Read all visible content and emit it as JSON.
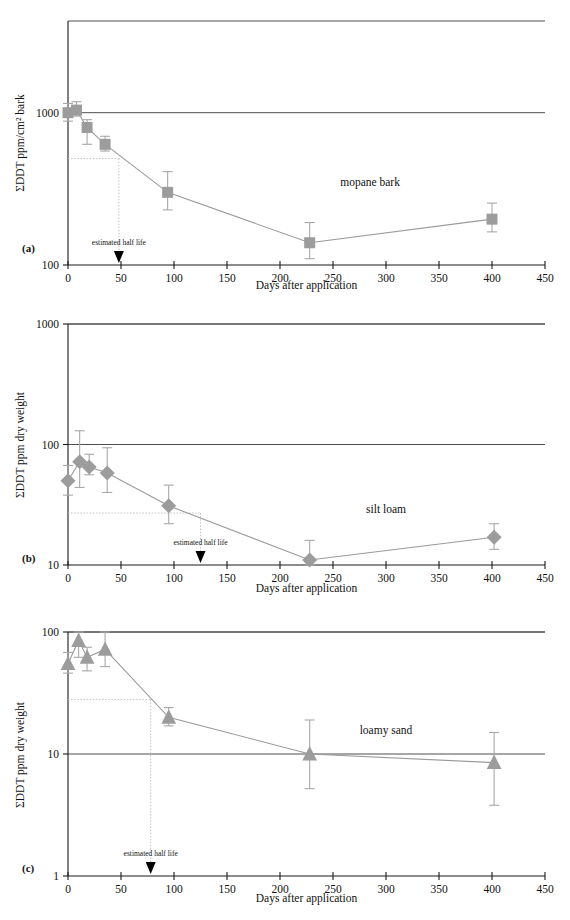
{
  "figure": {
    "panels": [
      {
        "letter": "(a)",
        "series_label": "mopane bark",
        "ylabel": "ΣDDT ppm/cm² bark",
        "xlabel": "Days after application",
        "halflife_label": "estimated half life"
      },
      {
        "letter": "(b)",
        "series_label": "silt loam",
        "ylabel": "ΣDDT ppm dry weight",
        "xlabel": "Days after application",
        "halflife_label": "estimated half life"
      },
      {
        "letter": "(c)",
        "series_label": "loamy sand",
        "ylabel": "ΣDDT ppm dry weight",
        "xlabel": "Days after application",
        "halflife_label": "estimated half life"
      }
    ]
  },
  "chart_data": [
    {
      "type": "line",
      "title": "mopane bark",
      "panel": "(a)",
      "xlabel": "Days after application",
      "ylabel": "ΣDDT ppm/cm² bark",
      "yscale": "log",
      "xlim": [
        0,
        450
      ],
      "ylim": [
        100,
        4000
      ],
      "xticks": [
        0,
        50,
        100,
        150,
        200,
        250,
        300,
        350,
        400,
        450
      ],
      "yticks": [
        100,
        1000
      ],
      "ytick_labels": [
        "100",
        "1000"
      ],
      "grid": true,
      "legend": "inline-label",
      "marker": "square",
      "marker_color": "#9c9c9c",
      "x": [
        0,
        8,
        18,
        35,
        94,
        228,
        400
      ],
      "y": [
        1000,
        1040,
        800,
        620,
        300,
        140,
        200
      ],
      "yerr_low": [
        880,
        950,
        620,
        560,
        230,
        110,
        165
      ],
      "yerr_high": [
        1150,
        1180,
        900,
        700,
        410,
        190,
        255
      ],
      "annotations": [
        {
          "text": "estimated half life",
          "x": 48,
          "y_level": 500,
          "type": "half-life-arrow"
        }
      ]
    },
    {
      "type": "line",
      "title": "silt loam",
      "panel": "(b)",
      "xlabel": "Days after application",
      "ylabel": "ΣDDT ppm dry weight",
      "yscale": "log",
      "xlim": [
        0,
        450
      ],
      "ylim": [
        10,
        1000
      ],
      "xticks": [
        0,
        50,
        100,
        150,
        200,
        250,
        300,
        350,
        400,
        450
      ],
      "yticks": [
        10,
        100,
        1000
      ],
      "ytick_labels": [
        "10",
        "100",
        "1000"
      ],
      "grid": true,
      "legend": "inline-label",
      "marker": "diamond",
      "marker_color": "#9c9c9c",
      "x": [
        0,
        11,
        20,
        37,
        95,
        228,
        402
      ],
      "y": [
        50,
        72,
        65,
        58,
        31,
        11,
        17
      ],
      "yerr_low": [
        38,
        44,
        56,
        40,
        22,
        10,
        13.5
      ],
      "yerr_high": [
        67,
        130,
        83,
        94,
        46,
        16,
        22
      ],
      "annotations": [
        {
          "text": "estimated half life",
          "x": 125,
          "y_level": 27,
          "type": "half-life-arrow"
        }
      ]
    },
    {
      "type": "line",
      "title": "loamy sand",
      "panel": "(c)",
      "xlabel": "Days after application",
      "ylabel": "ΣDDT ppm dry weight",
      "yscale": "log",
      "xlim": [
        0,
        450
      ],
      "ylim": [
        1,
        100
      ],
      "xticks": [
        0,
        50,
        100,
        150,
        200,
        250,
        300,
        350,
        400,
        450
      ],
      "yticks": [
        1,
        10,
        100
      ],
      "ytick_labels": [
        "1",
        "10",
        "100"
      ],
      "grid": true,
      "legend": "inline-label",
      "marker": "triangle",
      "marker_color": "#9c9c9c",
      "x": [
        0,
        10,
        18,
        35,
        95,
        228,
        402
      ],
      "y": [
        55,
        85,
        62,
        72,
        20,
        10,
        8.5
      ],
      "yerr_low": [
        46,
        62,
        48,
        52,
        17,
        5.2,
        3.8
      ],
      "yerr_high": [
        68,
        100,
        75,
        100,
        24,
        19,
        15
      ],
      "annotations": [
        {
          "text": "estimated half life",
          "x": 78,
          "y_level": 28,
          "type": "half-life-arrow"
        }
      ]
    }
  ]
}
